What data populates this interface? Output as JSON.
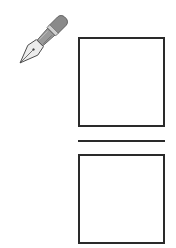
{
  "figure": {
    "icons": [
      {
        "name": "fountain-pen-icon",
        "color": "#888888"
      }
    ],
    "boxes": [
      {
        "id": "top-box",
        "content": ""
      },
      {
        "id": "bottom-box",
        "content": ""
      }
    ],
    "divider": {
      "present": true
    },
    "colors": {
      "stroke": "#2a2a2a",
      "background": "#ffffff",
      "pen_body": "#8a8a8a",
      "pen_nib": "#d8d8d8"
    }
  }
}
